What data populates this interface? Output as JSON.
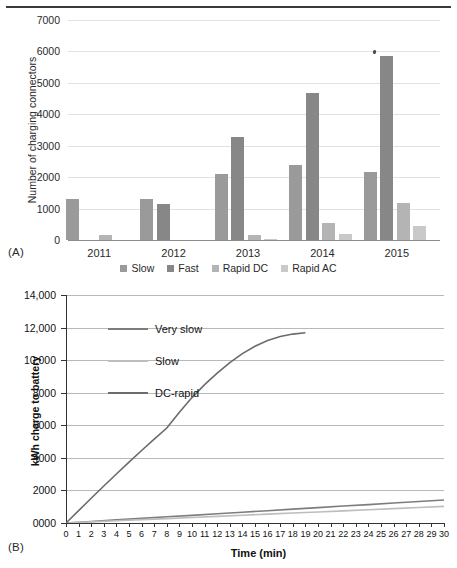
{
  "figure": {
    "panel_a_tag": "(A)",
    "panel_b_tag": "(B)"
  },
  "chart_data": [
    {
      "id": "A",
      "type": "bar",
      "title": "",
      "xlabel": "",
      "ylabel": "Number of charging connectors",
      "ylim": [
        0,
        7000
      ],
      "ytick_labels": [
        "0",
        "1000",
        "2000",
        "3000",
        "4000",
        "5000",
        "6000",
        "7000"
      ],
      "ytick_values": [
        0,
        1000,
        2000,
        3000,
        4000,
        5000,
        6000,
        7000
      ],
      "grid": true,
      "legend_position": "bottom",
      "categories": [
        "2011",
        "2012",
        "2013",
        "2014",
        "2015"
      ],
      "series": [
        {
          "name": "Slow",
          "color": "#9a9a9a",
          "values": [
            1320,
            1310,
            2090,
            2400,
            2160
          ]
        },
        {
          "name": "Fast",
          "color": "#878787",
          "values": [
            0,
            1160,
            3270,
            4670,
            5860
          ]
        },
        {
          "name": "Rapid DC",
          "color": "#b4b4b4",
          "values": [
            160,
            0,
            160,
            530,
            1190
          ]
        },
        {
          "name": "Rapid AC",
          "color": "#c9c9c9",
          "values": [
            0,
            0,
            30,
            180,
            450
          ]
        }
      ]
    },
    {
      "id": "B",
      "type": "line",
      "title": "",
      "xlabel": "Time (min)",
      "ylabel": "kWh charge to battery",
      "xlim": [
        0,
        30
      ],
      "ylim": [
        0,
        14000
      ],
      "xtick_labels": [
        "0",
        "1",
        "2",
        "3",
        "4",
        "5",
        "6",
        "7",
        "8",
        "9",
        "10",
        "11",
        "12",
        "13",
        "14",
        "15",
        "16",
        "17",
        "18",
        "19",
        "20",
        "21",
        "22",
        "23",
        "24",
        "25",
        "26",
        "27",
        "28",
        "29",
        "30"
      ],
      "ytick_labels": [
        "0000",
        "2000",
        "4000",
        "6000",
        "8000",
        "10,000",
        "12,000",
        "14,000"
      ],
      "ytick_values": [
        0,
        2000,
        4000,
        6000,
        8000,
        10000,
        12000,
        14000
      ],
      "grid": true,
      "legend_position": "upper-left-inside",
      "series": [
        {
          "name": "Very slow",
          "color": "#7d7d7d",
          "x": [
            0,
            2,
            4,
            6,
            8,
            10,
            12,
            14,
            16,
            18,
            20,
            22,
            24,
            26,
            28,
            30
          ],
          "values": [
            0,
            95,
            190,
            285,
            380,
            470,
            565,
            660,
            755,
            850,
            945,
            1040,
            1130,
            1225,
            1320,
            1415
          ]
        },
        {
          "name": "Slow",
          "color": "#bdbdbd",
          "x": [
            0,
            2,
            4,
            6,
            8,
            10,
            12,
            14,
            16,
            18,
            20,
            22,
            24,
            26,
            28,
            30
          ],
          "values": [
            0,
            70,
            135,
            205,
            270,
            340,
            405,
            475,
            545,
            610,
            680,
            745,
            815,
            880,
            950,
            1020
          ]
        },
        {
          "name": "DC-rapid",
          "color": "#6b6b6b",
          "x": [
            0,
            1,
            2,
            3,
            4,
            5,
            6,
            7,
            8,
            9,
            10,
            11,
            12,
            13,
            14,
            15,
            16,
            17,
            18,
            19
          ],
          "values": [
            0,
            760,
            1520,
            2270,
            3010,
            3740,
            4450,
            5150,
            5830,
            6800,
            7700,
            8500,
            9200,
            9850,
            10400,
            10850,
            11200,
            11450,
            11600,
            11680
          ]
        }
      ]
    }
  ]
}
